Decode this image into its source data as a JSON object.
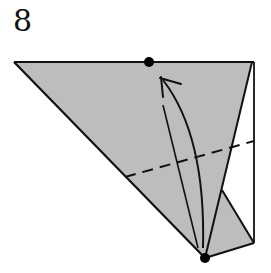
{
  "step": {
    "number": "8"
  },
  "colors": {
    "paper": "#bdbdbd",
    "line": "#111111",
    "background": "#ffffff"
  },
  "diagram": {
    "elements": [
      "top-edge",
      "left-diagonal-edge",
      "right-vertical-edge",
      "inner-flap-edge",
      "valley-fold-line",
      "fold-arrow",
      "reference-dot-top",
      "reference-dot-bottom"
    ]
  }
}
